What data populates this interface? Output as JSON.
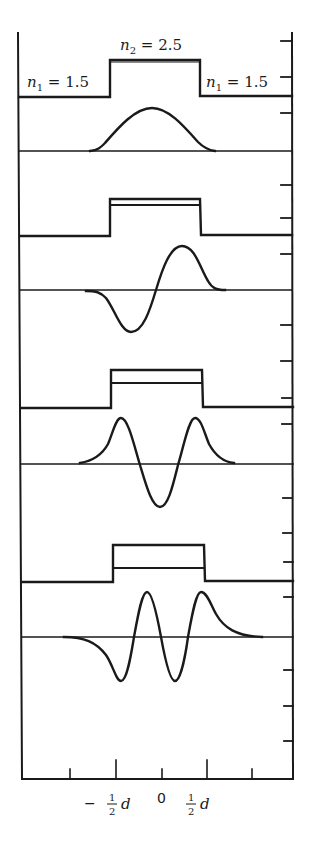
{
  "figure": {
    "labels": {
      "n2": "n",
      "n2_sub": "2",
      "n2_value": " = 2.5",
      "n1_left": "n",
      "n1_left_sub": "1",
      "n1_left_value": " = 1.5",
      "n1_right": "n",
      "n1_right_sub": "1",
      "n1_right_value": " = 1.5"
    },
    "x_axis": {
      "ticks": [
        {
          "label_minus": "−",
          "num": "1",
          "den": "2",
          "var": "d"
        },
        {
          "label": "0"
        },
        {
          "num": "1",
          "den": "2",
          "var": "d"
        }
      ]
    },
    "panels": [
      {
        "mode": "TE0",
        "mode_index": 0,
        "zero_crossings": 0
      },
      {
        "mode": "TE1",
        "mode_index": 1,
        "zero_crossings": 1
      },
      {
        "mode": "TE2",
        "mode_index": 2,
        "zero_crossings": 2
      },
      {
        "mode": "TE3",
        "mode_index": 3,
        "zero_crossings": 3
      }
    ],
    "colors": {
      "ink": "#1a1a1a",
      "background": "#ffffff"
    }
  }
}
